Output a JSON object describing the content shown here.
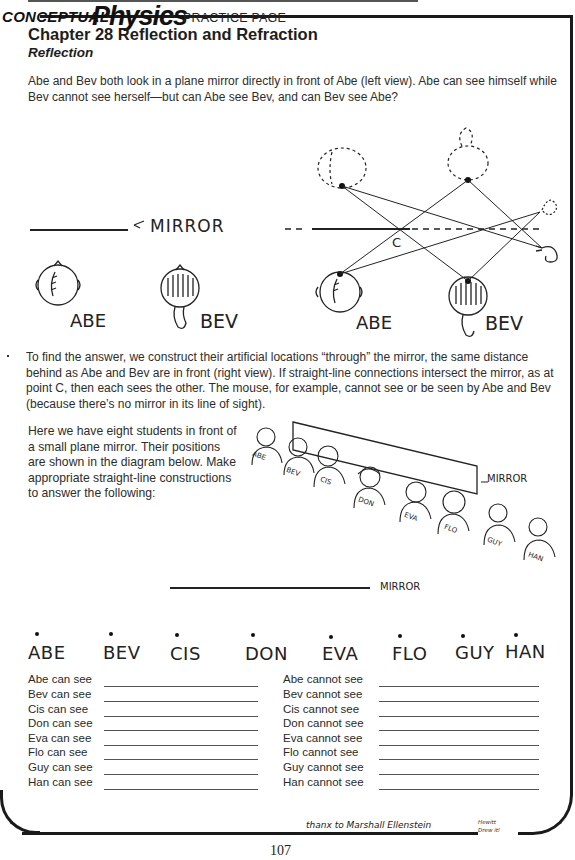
{
  "header": {
    "brand_prefix": "CONCEPTUAL",
    "brand_main": "Physics",
    "page_type": "PRACTICE PAGE",
    "chapter": "Chapter 28  Reflection and Refraction",
    "section": "Reflection"
  },
  "intro_paragraph": "Abe and Bev both look in a plane mirror directly in front of Abe (left view). Abe can see himself while Bev cannot see herself—but can Abe see Bev, and can Bev see Abe?",
  "figure1": {
    "left_view": {
      "mirror_label": "MIRROR",
      "people": [
        "ABE",
        "BEV"
      ]
    },
    "right_view": {
      "people": [
        "ABE",
        "BEV"
      ],
      "point_label": "C"
    }
  },
  "explanation_paragraph": "To find the answer, we construct their artificial locations “through” the mirror, the same distance behind as Abe and Bev are in front (right view). If straight-line connections intersect the mirror, as at point C, then each sees the other. The mouse, for example, cannot see or be seen by Abe and Bev (because there’s no mirror in its line of sight).",
  "task_paragraph": "Here we have eight students in front of a small plane mirror. Their positions are shown in the diagram below. Make appropriate straight-line constructions to answer the following:",
  "figure2": {
    "mirror_label": "MIRROR",
    "students": [
      "ABE",
      "BEV",
      "CIS",
      "DON",
      "EVA",
      "FLO",
      "GUY",
      "HAN"
    ]
  },
  "figure3": {
    "mirror_label": "MIRROR",
    "students": [
      "ABE",
      "BEV",
      "CIS",
      "DON",
      "EVA",
      "FLO",
      "GUY",
      "HAN"
    ]
  },
  "answers": {
    "can_see": [
      {
        "label": "Abe can see",
        "value": ""
      },
      {
        "label": "Bev can see",
        "value": ""
      },
      {
        "label": "Cis can see",
        "value": ""
      },
      {
        "label": "Don can see",
        "value": ""
      },
      {
        "label": "Eva can see",
        "value": ""
      },
      {
        "label": "Flo can see",
        "value": ""
      },
      {
        "label": "Guy can see",
        "value": ""
      },
      {
        "label": "Han can see",
        "value": ""
      }
    ],
    "cannot_see": [
      {
        "label": "Abe cannot see",
        "value": ""
      },
      {
        "label": "Bev cannot see",
        "value": ""
      },
      {
        "label": "Cis cannot see",
        "value": ""
      },
      {
        "label": "Don cannot see",
        "value": ""
      },
      {
        "label": "Eva cannot see",
        "value": ""
      },
      {
        "label": "Flo cannot see",
        "value": ""
      },
      {
        "label": "Guy cannot see",
        "value": ""
      },
      {
        "label": "Han cannot see",
        "value": ""
      }
    ]
  },
  "footer": {
    "credit": "thanx to Marshall Ellenstein",
    "signature": "Hewitt Drew it!",
    "page_number": "107"
  }
}
